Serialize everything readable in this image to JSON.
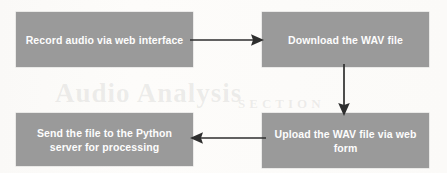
{
  "diagram": {
    "background_color": "#fbfaf8",
    "node_fill_color": "#9a9a9a",
    "node_text_color": "#fdfdfd",
    "arrow_color": "#2e2e2e",
    "nodes": [
      {
        "id": "record",
        "label": "Record audio via web interface",
        "position": "top-left"
      },
      {
        "id": "download",
        "label": "Download the WAV file",
        "position": "top-right"
      },
      {
        "id": "upload",
        "label": "Upload the WAV file via web form",
        "position": "bottom-right"
      },
      {
        "id": "send",
        "label": "Send the file to the Python server for processing",
        "position": "bottom-left"
      }
    ],
    "edges": [
      {
        "id": "record-to-download",
        "from": "record",
        "to": "download",
        "direction": "right"
      },
      {
        "id": "download-to-upload",
        "from": "download",
        "to": "upload",
        "direction": "down"
      },
      {
        "id": "upload-to-send",
        "from": "upload",
        "to": "send",
        "direction": "left"
      }
    ],
    "ghost_text": {
      "line1": "Audio Analysis",
      "line2": "CHAPTER",
      "line3": "SECTION"
    }
  }
}
